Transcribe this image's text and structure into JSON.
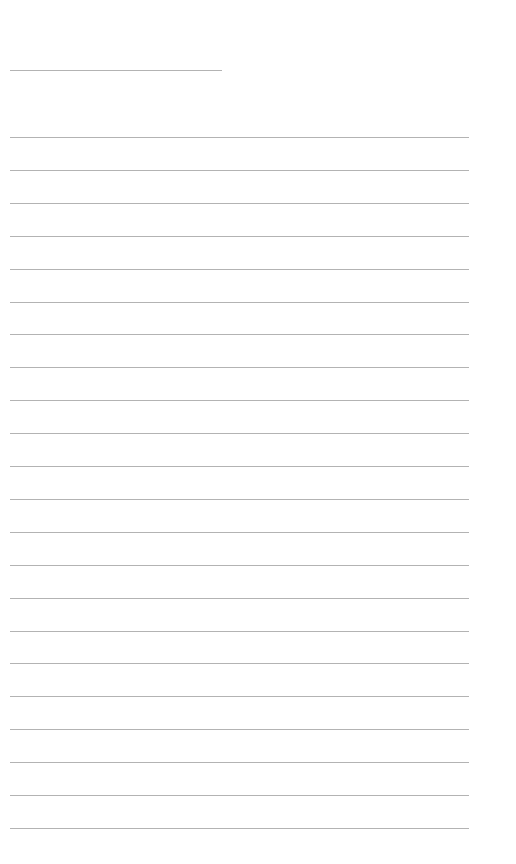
{
  "page": {
    "type": "lined-paper",
    "title_line": {
      "label": ""
    },
    "line_count": 22,
    "line_spacing_px": 32.9,
    "line_color": "#9a9a9a",
    "background": "#ffffff"
  }
}
